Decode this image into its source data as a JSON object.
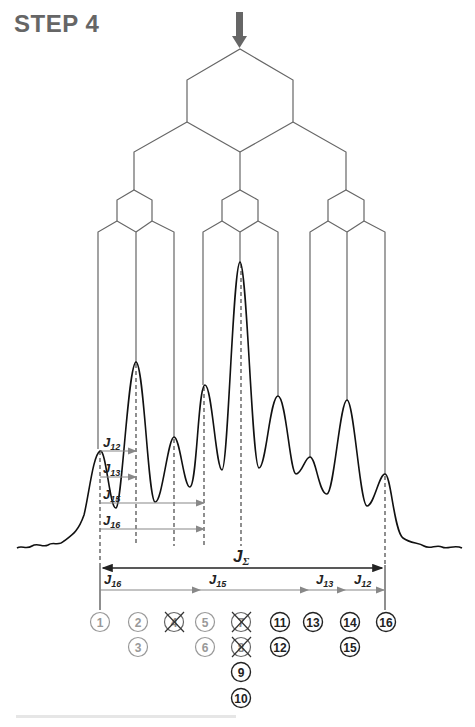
{
  "header": {
    "title": "STEP 4"
  },
  "diagram": {
    "type": "NMR multiplet splitting tree",
    "labels": {
      "j_sum": "J",
      "j_sum_sub": "Σ",
      "j_arrows_top": [
        {
          "main": "J",
          "sub": "12"
        },
        {
          "main": "J",
          "sub": "13"
        },
        {
          "main": "J",
          "sub": "15"
        },
        {
          "main": "J",
          "sub": "16"
        }
      ],
      "j_arrows_bottom": [
        {
          "main": "J",
          "sub": "16"
        },
        {
          "main": "J",
          "sub": "15"
        },
        {
          "main": "J",
          "sub": "13"
        },
        {
          "main": "J",
          "sub": "12"
        }
      ]
    },
    "circled_numbers": {
      "col1": [
        "1"
      ],
      "col2": [
        "2",
        "3"
      ],
      "col3": [
        "4"
      ],
      "col4": [
        "5",
        "6"
      ],
      "col5": [
        "7",
        "8",
        "9",
        "10"
      ],
      "col6": [
        "11",
        "12"
      ],
      "col7": [
        "13"
      ],
      "col8": [
        "14",
        "15"
      ],
      "col9": [
        "16"
      ]
    },
    "crossed_out": [
      "4",
      "7",
      "8"
    ],
    "colors": {
      "line": "#555555",
      "spectrum": "#111111",
      "arrow": "#888888",
      "faded": "#999999"
    }
  },
  "caption": {
    "text": ""
  }
}
